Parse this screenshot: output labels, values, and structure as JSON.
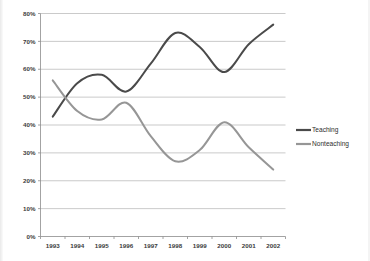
{
  "chart_data": {
    "type": "line",
    "title": "",
    "xlabel": "",
    "ylabel": "",
    "categories": [
      "1993",
      "1994",
      "1995",
      "1996",
      "1997",
      "1998",
      "1999",
      "2000",
      "2001",
      "2002"
    ],
    "x": [
      1993,
      1994,
      1995,
      1996,
      1997,
      1998,
      1999,
      2000,
      2001,
      2002
    ],
    "ylim": [
      0,
      80
    ],
    "ytick_labels": [
      "0%",
      "10%",
      "20%",
      "30%",
      "40%",
      "50%",
      "60%",
      "70%",
      "80%"
    ],
    "ytick_values": [
      0,
      10,
      20,
      30,
      40,
      50,
      60,
      70,
      80
    ],
    "grid": true,
    "legend_position": "right",
    "smoothing": "spline",
    "series": [
      {
        "name": "Teaching",
        "color": "#4a4a4a",
        "values": [
          43,
          55,
          58,
          52,
          62,
          73,
          68,
          59,
          69,
          76
        ]
      },
      {
        "name": "Nonteaching",
        "color": "#969696",
        "values": [
          56,
          45,
          42,
          48,
          36,
          27,
          31,
          41,
          32,
          24
        ]
      }
    ]
  },
  "legend": {
    "items": [
      {
        "label": "Teaching",
        "color": "#4a4a4a"
      },
      {
        "label": "Nonteaching",
        "color": "#969696"
      }
    ]
  },
  "colors": {
    "teaching": "#4a4a4a",
    "nonteaching": "#969696",
    "grid": "#b3b3b3",
    "axis": "#8c8c8c",
    "background": "#ffffff",
    "text": "#3b3b3b"
  }
}
